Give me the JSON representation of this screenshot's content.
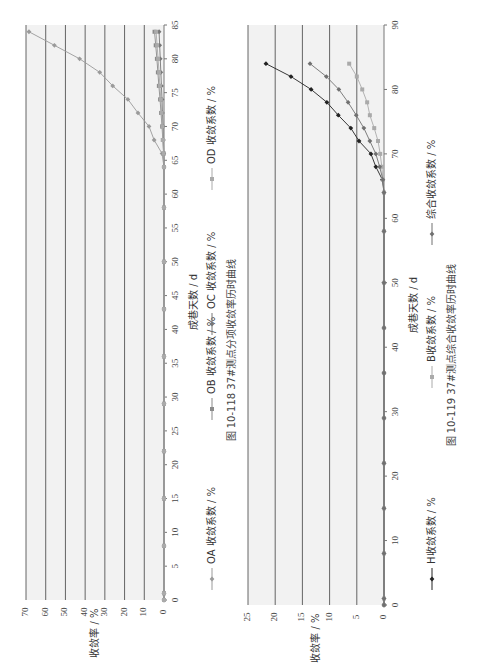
{
  "chart_data": [
    {
      "type": "line",
      "figure_id": "图 10-118",
      "title": "37#测点分项收敛率历时曲线",
      "xlabel": "成巷天数 / d",
      "ylabel": "收敛率 / %",
      "xlim": [
        0,
        85
      ],
      "ylim": [
        0,
        70
      ],
      "x_ticks": [
        0,
        5,
        10,
        15,
        20,
        25,
        30,
        35,
        40,
        45,
        50,
        55,
        60,
        65,
        70,
        75,
        80,
        85
      ],
      "y_ticks": [
        0,
        10,
        20,
        30,
        40,
        50,
        60,
        70
      ],
      "grid": true,
      "legend_position": "bottom",
      "x": [
        0,
        1,
        8,
        15,
        22,
        29,
        36,
        43,
        50,
        58,
        64,
        66,
        68,
        70,
        72,
        74,
        76,
        78,
        80,
        82,
        84
      ],
      "series": [
        {
          "name": "OA 收敛系数 / %",
          "color": "#9a9a9a",
          "values": [
            0,
            0,
            0,
            0,
            0,
            0,
            0,
            0,
            0,
            0,
            0,
            1.0,
            5.0,
            7.6,
            13.2,
            18.3,
            26.0,
            32.6,
            42.8,
            55.6,
            68.5
          ]
        },
        {
          "name": "OB 收敛系数 / %",
          "color": "#8a8a8a",
          "values": [
            0,
            0,
            0,
            0,
            0,
            0,
            0,
            0,
            0,
            0,
            0,
            0.2,
            0.6,
            1.0,
            1.5,
            2.0,
            2.6,
            3.1,
            3.6,
            4.2,
            4.8
          ]
        },
        {
          "name": "OC 收敛系数 / %",
          "color": "#777777",
          "values": [
            0,
            0,
            0,
            0,
            0,
            0,
            0,
            0,
            0,
            0,
            0,
            0.1,
            0.3,
            0.5,
            0.8,
            1.0,
            1.3,
            1.6,
            1.9,
            2.2,
            2.5
          ]
        },
        {
          "name": "OD 收敛系数 / %",
          "color": "#aaaaaa",
          "values": [
            0,
            0,
            0,
            0,
            0,
            0,
            0,
            0,
            0,
            0,
            0,
            0.2,
            0.5,
            0.8,
            1.2,
            1.6,
            2.1,
            2.5,
            3.0,
            3.5,
            4.0
          ]
        }
      ]
    },
    {
      "type": "line",
      "figure_id": "图 10-119",
      "title": "37#测点综合收敛率历时曲线",
      "xlabel": "成巷天数 / d",
      "ylabel": "收敛率 / %",
      "xlim": [
        0,
        90
      ],
      "ylim": [
        0,
        25
      ],
      "x_ticks": [
        0,
        10,
        20,
        30,
        40,
        50,
        60,
        70,
        80,
        90
      ],
      "y_ticks": [
        0,
        5,
        10,
        15,
        20,
        25
      ],
      "grid": true,
      "legend_position": "bottom",
      "x": [
        0,
        1,
        8,
        15,
        22,
        29,
        36,
        43,
        50,
        58,
        64,
        66,
        68,
        70,
        72,
        74,
        76,
        78,
        80,
        82,
        84
      ],
      "series": [
        {
          "name": "H收敛系数 / %",
          "color": "#222222",
          "values": [
            0,
            0,
            0,
            0,
            0,
            0,
            0,
            0,
            0,
            0,
            0,
            0.3,
            1.5,
            2.4,
            4.6,
            6.1,
            8.4,
            10.5,
            13.4,
            17.1,
            21.7
          ]
        },
        {
          "name": "B收敛系数 / %",
          "color": "#aaaaaa",
          "values": [
            0,
            0,
            0,
            0,
            0,
            0,
            0,
            0,
            0,
            0,
            0,
            0.2,
            0.4,
            0.7,
            1.1,
            1.8,
            2.6,
            3.1,
            4.0,
            5.0,
            6.4
          ]
        },
        {
          "name": "综合收敛系数 / %",
          "color": "#707070",
          "values": [
            0,
            0,
            0,
            0,
            0,
            0,
            0,
            0,
            0,
            0,
            0,
            0.2,
            0.8,
            1.5,
            2.6,
            3.7,
            5.1,
            6.6,
            8.3,
            10.6,
            13.6
          ]
        }
      ]
    }
  ],
  "fig1": {
    "caption": "图 10-118   37#测点分项收敛率历时曲线",
    "xlabel": "成巷天数 / d",
    "ylabel": "收敛率 / %",
    "legend": [
      "OA 收敛系数 / %",
      "OB 收敛系数 / %",
      "OC 收敛系数 / %",
      "OD 收敛系数 / %"
    ]
  },
  "fig2": {
    "caption": "图 10-119   37#测点综合收敛率历时曲线",
    "xlabel": "成巷天数 / d",
    "ylabel": "收敛率 / %",
    "legend": [
      "H收敛系数 / %",
      "B收敛系数 / %",
      "综合收敛系数 / %"
    ]
  }
}
